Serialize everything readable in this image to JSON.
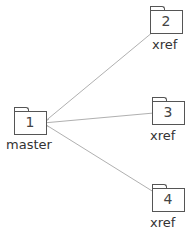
{
  "diagram": {
    "nodes": [
      {
        "id": "1",
        "label": "master",
        "number": "1"
      },
      {
        "id": "2",
        "label": "xref",
        "number": "2"
      },
      {
        "id": "3",
        "label": "xref",
        "number": "3"
      },
      {
        "id": "4",
        "label": "xref",
        "number": "4"
      }
    ],
    "edges": [
      {
        "from": "2",
        "to": "1"
      },
      {
        "from": "3",
        "to": "1"
      },
      {
        "from": "4",
        "to": "1"
      }
    ],
    "colors": {
      "edge": "#b0b0b0",
      "folder_stroke": "#555555",
      "text": "#333333"
    }
  }
}
